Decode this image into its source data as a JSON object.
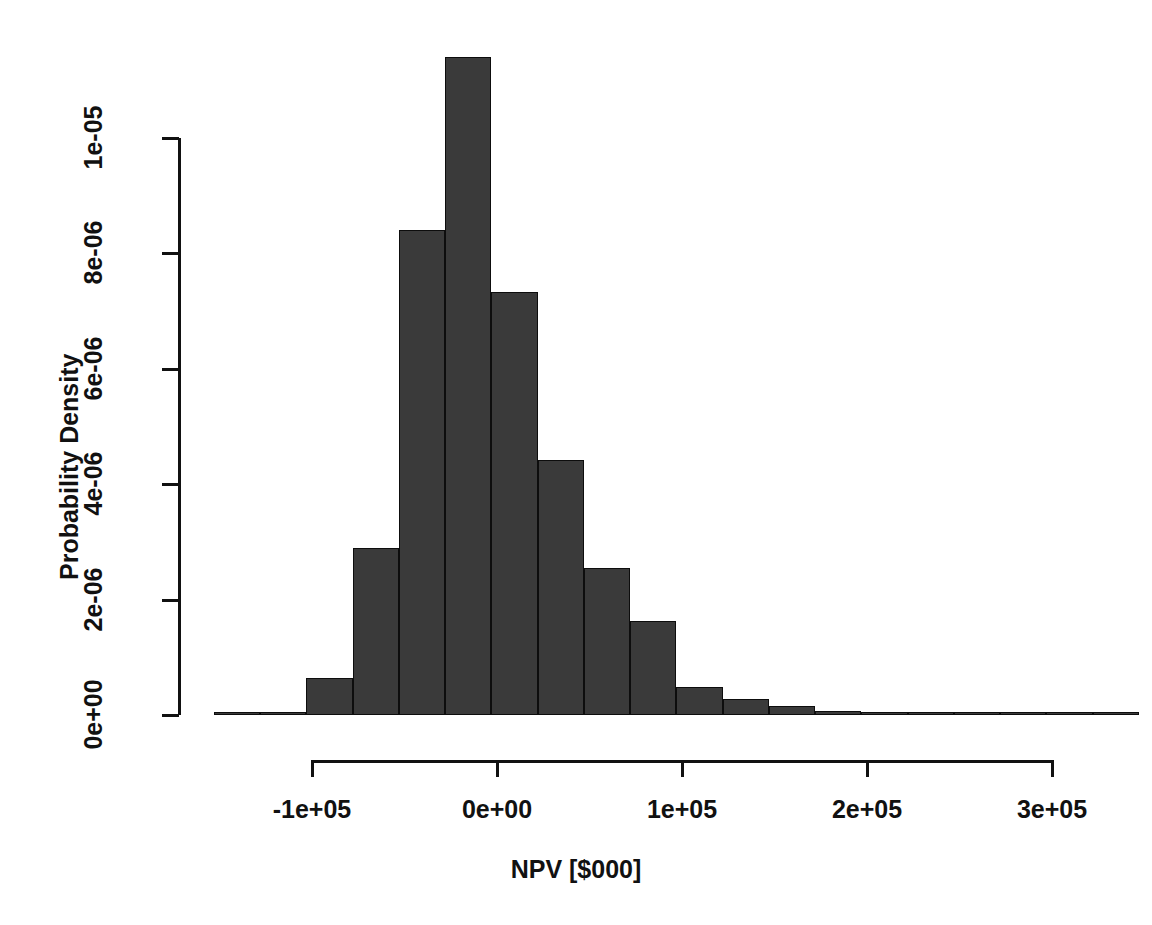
{
  "chart_data": {
    "type": "bar",
    "chart_subtype": "histogram",
    "title": "",
    "xlabel": "NPV [$000]",
    "ylabel": "Probability Density",
    "xlim": [
      -160000,
      340000
    ],
    "ylim": [
      0,
      1.14e-05
    ],
    "grid": false,
    "legend": "none",
    "bar_color": "#3a3a3a",
    "bar_border_color": "#0d0d0d",
    "bin_width": 25000,
    "x_ticks": [
      {
        "value": -100000,
        "label": "-1e+05"
      },
      {
        "value": 0,
        "label": "0e+00"
      },
      {
        "value": 100000,
        "label": "1e+05"
      },
      {
        "value": 200000,
        "label": "2e+05"
      },
      {
        "value": 300000,
        "label": "3e+05"
      }
    ],
    "y_ticks": [
      {
        "value": 0.0,
        "label": "0e+00"
      },
      {
        "value": 2e-06,
        "label": "2e-06"
      },
      {
        "value": 4e-06,
        "label": "4e-06"
      },
      {
        "value": 6e-06,
        "label": "6e-06"
      },
      {
        "value": 8e-06,
        "label": "8e-06"
      },
      {
        "value": 1e-05,
        "label": "1e-05"
      }
    ],
    "bins": [
      {
        "x0": -153000,
        "x1": -128000,
        "density": 2e-08
      },
      {
        "x0": -128000,
        "x1": -103000,
        "density": 0.0
      },
      {
        "x0": -103000,
        "x1": -78000,
        "density": 6.4e-07
      },
      {
        "x0": -78000,
        "x1": -53000,
        "density": 2.9e-06
      },
      {
        "x0": -53000,
        "x1": -28000,
        "density": 8.41e-06
      },
      {
        "x0": -28000,
        "x1": -3000,
        "density": 1.14e-05
      },
      {
        "x0": -3000,
        "x1": 22000,
        "density": 7.33e-06
      },
      {
        "x0": 22000,
        "x1": 47000,
        "density": 4.42e-06
      },
      {
        "x0": 47000,
        "x1": 72000,
        "density": 2.55e-06
      },
      {
        "x0": 72000,
        "x1": 97000,
        "density": 1.63e-06
      },
      {
        "x0": 97000,
        "x1": 122000,
        "density": 4.9e-07
      },
      {
        "x0": 122000,
        "x1": 147000,
        "density": 2.8e-07
      },
      {
        "x0": 147000,
        "x1": 172000,
        "density": 1.6e-07
      },
      {
        "x0": 172000,
        "x1": 197000,
        "density": 7e-08
      },
      {
        "x0": 197000,
        "x1": 222000,
        "density": 2e-08
      },
      {
        "x0": 222000,
        "x1": 247000,
        "density": 0.0
      },
      {
        "x0": 247000,
        "x1": 272000,
        "density": 2e-08
      },
      {
        "x0": 272000,
        "x1": 297000,
        "density": 0.0
      },
      {
        "x0": 297000,
        "x1": 322000,
        "density": 0.0
      },
      {
        "x0": 322000,
        "x1": 347000,
        "density": 2e-08
      }
    ]
  },
  "axes": {
    "x_title": "NPV [$000]",
    "y_title": "Probability Density"
  }
}
